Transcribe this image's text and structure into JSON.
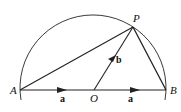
{
  "diagram": {
    "colors": {
      "stroke": "#222222",
      "background": "#ffffff"
    },
    "points": {
      "A": {
        "label": "A",
        "x": 20,
        "y": 90
      },
      "B": {
        "label": "B",
        "x": 166,
        "y": 90
      },
      "O": {
        "label": "O",
        "x": 93,
        "y": 90
      },
      "P": {
        "label": "P",
        "x": 133,
        "y": 27
      }
    },
    "circle": {
      "center": "O",
      "radius": 73
    },
    "segments": [
      {
        "from": "A",
        "to": "P"
      },
      {
        "from": "P",
        "to": "B"
      },
      {
        "from": "A",
        "to": "B"
      },
      {
        "from": "O",
        "to": "P"
      }
    ],
    "vectors": [
      {
        "label": "a",
        "from": "A",
        "to": "O"
      },
      {
        "label": "a",
        "from": "O",
        "to": "B"
      },
      {
        "label": "b",
        "from": "O",
        "to": "P"
      }
    ],
    "labels": {
      "A": "A",
      "B": "B",
      "O": "O",
      "P": "P",
      "vec_a_left": "a",
      "vec_a_right": "a",
      "vec_b": "b"
    }
  }
}
